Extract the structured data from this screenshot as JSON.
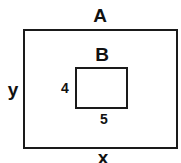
{
  "diagram": {
    "type": "nested-rectangles",
    "outer_rectangle": {
      "name": "A",
      "width_label": "x",
      "height_label": "y"
    },
    "inner_rectangle": {
      "name": "B",
      "width_label": "5",
      "height_label": "4"
    },
    "colors": {
      "stroke": "#1a1a1a",
      "text": "#111111",
      "background": "#ffffff"
    }
  }
}
